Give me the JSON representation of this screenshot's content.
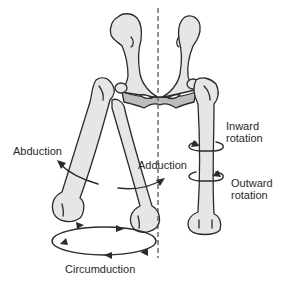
{
  "diagram": {
    "colors": {
      "bone_fill": "#e6e6e6",
      "pelvis_fill": "#bdbdbd",
      "outline": "#2b2b2b",
      "axis_line": "#555555",
      "text": "#2a2a2a"
    },
    "labels": {
      "abduction": "Abduction",
      "adduction": "Adduction",
      "inward_rotation_line1": "Inward",
      "inward_rotation_line2": "rotation",
      "outward_rotation_line1": "Outward",
      "outward_rotation_line2": "rotation",
      "circumduction": "Circumduction"
    }
  }
}
